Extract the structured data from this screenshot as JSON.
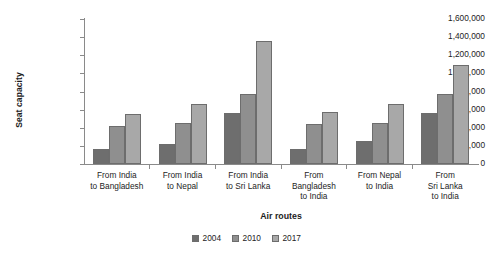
{
  "chart_data": {
    "type": "bar",
    "title": "",
    "xlabel": "Air routes",
    "ylabel": "Seat capacity",
    "categories": [
      "From India to Bangladesh",
      "From India to Nepal",
      "From India to Sri Lanka",
      "From Bangladesh to India",
      "From Nepal to India",
      "From Sri Lanka to India"
    ],
    "category_lines": [
      [
        "From India",
        "to Bangladesh"
      ],
      [
        "From India",
        "to Nepal"
      ],
      [
        "From India",
        "to Sri Lanka"
      ],
      [
        "From",
        "Bangladesh",
        "to India"
      ],
      [
        "From Nepal",
        "to India"
      ],
      [
        "From",
        "Sri Lanka",
        "to India"
      ]
    ],
    "series": [
      {
        "name": "2004",
        "color": "#6e6e6e",
        "values": [
          163000,
          219000,
          564000,
          163000,
          251000,
          561000
        ]
      },
      {
        "name": "2010",
        "color": "#8f8f8f",
        "values": [
          424000,
          450000,
          771000,
          443000,
          450000,
          771000
        ]
      },
      {
        "name": "2017",
        "color": "#a8a8a8",
        "values": [
          553000,
          660000,
          1357000,
          575000,
          664000,
          1095000
        ]
      }
    ],
    "ylim": [
      0,
      1600000
    ],
    "ytick_values": [
      0,
      200000,
      400000,
      600000,
      800000,
      1000000,
      1200000,
      1400000,
      1600000
    ],
    "ytick_labels": [
      "0",
      "200,000",
      "400,000",
      "600,000",
      "800,000",
      "1,000,000",
      "1,200,000",
      "1,400,000",
      "1,600,000"
    ],
    "grid": false,
    "legend_position": "bottom-center"
  },
  "axes": {
    "y_title": "Seat capacity",
    "x_title": "Air routes"
  },
  "legend": {
    "items": [
      {
        "label": "2004",
        "color": "#6e6e6e"
      },
      {
        "label": "2010",
        "color": "#8f8f8f"
      },
      {
        "label": "2017",
        "color": "#a8a8a8"
      }
    ]
  },
  "colors": {
    "axis": "#8a8a8a",
    "text": "#1d1d1d",
    "background": "#ffffff",
    "bar_border": "#6d6d6d"
  }
}
